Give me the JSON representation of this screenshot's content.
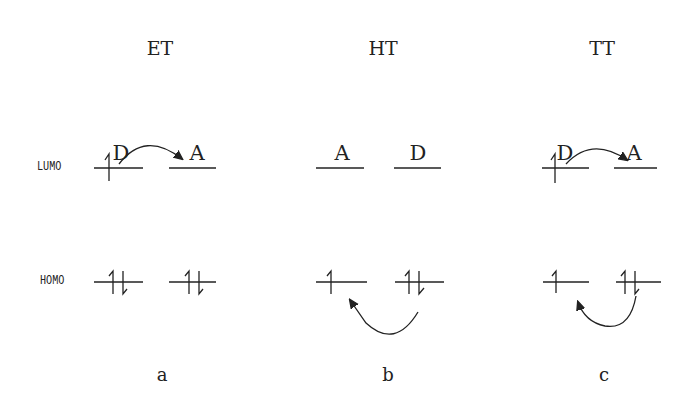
{
  "figure": {
    "panels": [
      {
        "id": "a",
        "title": "ET",
        "left_label": "D",
        "right_label": "A",
        "caption": "a"
      },
      {
        "id": "b",
        "title": "HT",
        "left_label": "A",
        "right_label": "D",
        "caption": "b"
      },
      {
        "id": "c",
        "title": "TT",
        "left_label": "D",
        "right_label": "A",
        "caption": "c"
      }
    ],
    "levels": {
      "upper": "LUMO",
      "lower": "HOMO"
    }
  }
}
